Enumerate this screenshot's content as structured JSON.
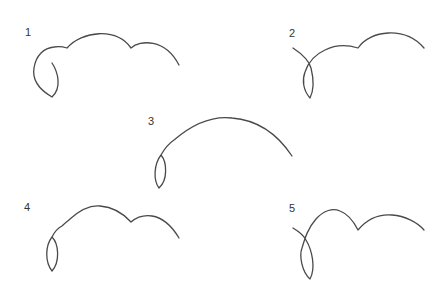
{
  "figure": {
    "colors": {
      "stroke": "#4a4a4a",
      "label": "#333333",
      "background": "#ffffff"
    }
  },
  "curves": [
    {
      "label": "1",
      "path": "M52,63 C58,72 62,88 52,97 C40,90 32,80 34,68 C36,55 44,48 54,47 C60,46 64,47 67,48 C82,31 116,27 131,48 C140,40 165,38 179,65"
    },
    {
      "label": "2",
      "path": "M293,48 C302,54 309,60 311,68 C314,80 314,90 310,98 C303,90 302,80 305,72 C309,60 316,54 325,50 C333,46 345,44 358,48 C370,30 405,26 424,48"
    },
    {
      "label": "3",
      "path": "M161,155 C167,162 168,180 159,188 C153,180 154,164 161,155 C165,148 168,144 174,140 C195,122 215,116 232,118 C258,120 278,135 292,156"
    },
    {
      "label": "4",
      "path": "M52,237 C59,244 60,262 52,271 C45,262 45,246 52,237 C55,231 58,228 62,226 C66,222 68,221 70,219 C80,210 90,205 100,206 C112,207 122,212 131,222 C138,216 145,215 152,216 C165,218 173,228 179,238"
    },
    {
      "label": "5",
      "path": "M293,228 C298,231 303,234 306,240 C312,250 316,268 310,279 C302,272 299,256 302,248 C305,238 308,228 316,219 C324,210 333,208 340,211 C348,214 354,222 358,230 C368,218 380,214 392,215 C405,216 417,222 424,230"
    }
  ]
}
